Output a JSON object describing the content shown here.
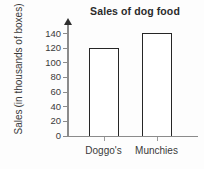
{
  "chart_data": {
    "type": "bar",
    "title": "Sales of dog food",
    "xlabel": "",
    "ylabel": "Sales (in thousands of boxes)",
    "ylabel_lines": [
      "Sales",
      "(in thousands of boxes)"
    ],
    "categories": [
      "Doggo's",
      "Munchies"
    ],
    "values": [
      120,
      141
    ],
    "ylim": [
      0,
      145
    ],
    "yticks": [
      0,
      20,
      40,
      60,
      80,
      100,
      120,
      140
    ],
    "ytick_labels": [
      "0",
      "20",
      "40",
      "60",
      "80",
      "100",
      "120",
      "140"
    ],
    "grid": false,
    "legend": null,
    "bar_fill_color": "#ffffff",
    "bar_border_color": "#262626",
    "axis_color": "#8b8b8b",
    "text_color": "#3a3a3a",
    "background_color": "#fdfdfd"
  }
}
